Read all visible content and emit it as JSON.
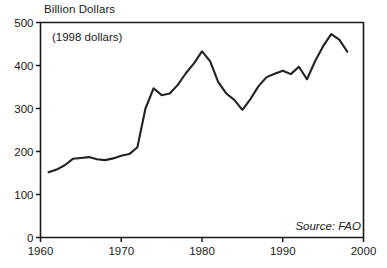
{
  "chart_data": {
    "type": "line",
    "title": "Billion Dollars",
    "xlabel": "",
    "ylabel": "Billion Dollars",
    "annotations": [
      "(1998 dollars)",
      "Source: FAO"
    ],
    "note_inflation": "(1998 dollars)",
    "source": "Source: FAO",
    "grid": false,
    "legend": "none",
    "xlim": [
      1960,
      2000
    ],
    "ylim": [
      0,
      500
    ],
    "xticks": [
      1960,
      1970,
      1980,
      1990,
      2000
    ],
    "yticks": [
      0,
      100,
      200,
      300,
      400,
      500
    ],
    "xtick_labels": [
      "1960",
      "1970",
      "1980",
      "1990",
      "2000"
    ],
    "ytick_labels": [
      "0",
      "100",
      "200",
      "300",
      "400",
      "500"
    ],
    "series": [
      {
        "name": "Agricultural exports",
        "color": "#222222",
        "x": [
          1961,
          1962,
          1963,
          1964,
          1965,
          1966,
          1967,
          1968,
          1969,
          1970,
          1971,
          1972,
          1973,
          1974,
          1975,
          1976,
          1977,
          1978,
          1979,
          1980,
          1981,
          1982,
          1983,
          1984,
          1985,
          1986,
          1987,
          1988,
          1989,
          1990,
          1991,
          1992,
          1993,
          1994,
          1995,
          1996,
          1997,
          1998
        ],
        "values": [
          152,
          158,
          168,
          183,
          185,
          187,
          182,
          180,
          184,
          190,
          194,
          210,
          300,
          347,
          331,
          335,
          355,
          382,
          405,
          433,
          410,
          362,
          335,
          320,
          297,
          322,
          352,
          373,
          381,
          388,
          380,
          397,
          368,
          410,
          445,
          473,
          460,
          432
        ]
      }
    ]
  },
  "axes": {
    "y_title": "Billion Dollars"
  }
}
